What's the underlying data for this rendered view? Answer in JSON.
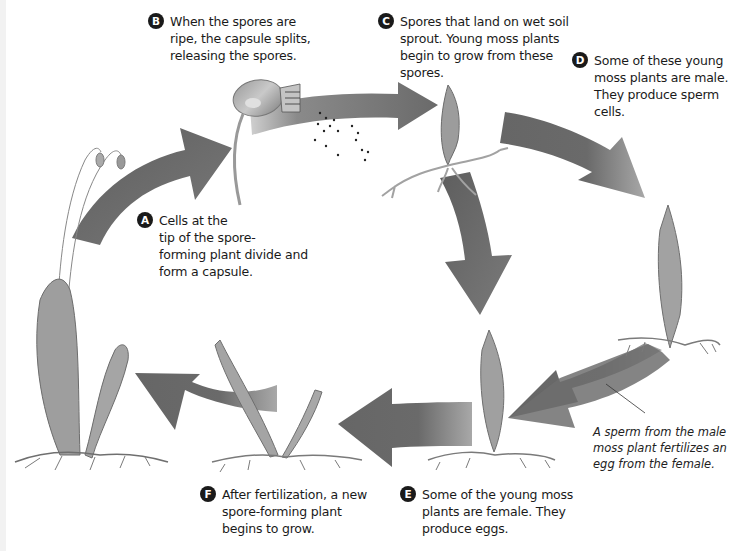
{
  "diagram": {
    "type": "cycle",
    "colors": {
      "arrow": "#6e6e6e",
      "arrow_light": "#a9a9a9",
      "plant": "#8a8a8a",
      "badge": "#1a1a1a",
      "background": "#ffffff"
    }
  },
  "steps": [
    {
      "id": "A",
      "label": "A",
      "text": "Cells at the tip of the spore-forming plant divide and form a capsule.",
      "lines": [
        "Cells at the",
        "tip of the spore-",
        "forming plant divide and",
        "form a capsule."
      ]
    },
    {
      "id": "B",
      "label": "B",
      "text": "When the spores are ripe, the capsule splits, releasing the spores.",
      "lines": [
        "When the spores are",
        "ripe, the capsule splits,",
        "releasing the spores."
      ]
    },
    {
      "id": "C",
      "label": "C",
      "text": "Spores that land on wet soil sprout. Young moss plants begin to grow from these spores.",
      "lines": [
        "Spores that land on wet soil",
        "sprout. Young moss plants",
        "begin to grow from these",
        "spores."
      ]
    },
    {
      "id": "D",
      "label": "D",
      "text": "Some of these young moss plants are male. They produce sperm cells.",
      "lines": [
        "Some of these young",
        "moss plants are male.",
        "They produce sperm",
        "cells."
      ]
    },
    {
      "id": "E",
      "label": "E",
      "text": "Some of the young moss plants are female. They produce eggs.",
      "lines": [
        "Some of the young moss",
        "plants are female. They",
        "produce eggs."
      ]
    },
    {
      "id": "F",
      "label": "F",
      "text": "After fertilization, a new spore-forming plant begins to grow.",
      "lines": [
        "After fertilization, a new",
        "spore-forming plant",
        "begins to grow."
      ]
    }
  ],
  "annotation": {
    "text": "A sperm from the male moss plant fertilizes an egg from the female.",
    "lines": [
      "A sperm from the male",
      "moss plant fertilizes an",
      "egg from the female."
    ]
  },
  "illustrations": [
    {
      "name": "spore-forming-plant-mature",
      "description": "Mature moss with stalks and capsules (left)"
    },
    {
      "name": "capsule-releasing-spores",
      "description": "Capsule splitting, spores dispersing (top center)"
    },
    {
      "name": "sprouting-young-moss",
      "description": "Young moss sprouting with rhizoids (top right-center)"
    },
    {
      "name": "male-moss-plant",
      "description": "Male moss plant (right)"
    },
    {
      "name": "female-moss-plant",
      "description": "Female moss plant (bottom center)"
    },
    {
      "name": "new-spore-forming-plant",
      "description": "New spore-forming plant growing (bottom left-center)"
    }
  ]
}
